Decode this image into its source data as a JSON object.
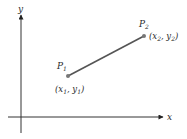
{
  "diagram": {
    "type": "line-segment-between-two-points",
    "axes": {
      "x_label": "x",
      "y_label": "y"
    },
    "points": [
      {
        "name": "P",
        "index": "1",
        "coord_label": {
          "x": "x",
          "x_sub": "1",
          "y": "y",
          "y_sub": "1"
        }
      },
      {
        "name": "P",
        "index": "2",
        "coord_label": {
          "x": "x",
          "x_sub": "2",
          "y": "y",
          "y_sub": "2"
        }
      }
    ],
    "colors": {
      "axis": "#333333",
      "segment": "#555555",
      "point": "#777777",
      "text": "#2a2a2a"
    }
  }
}
